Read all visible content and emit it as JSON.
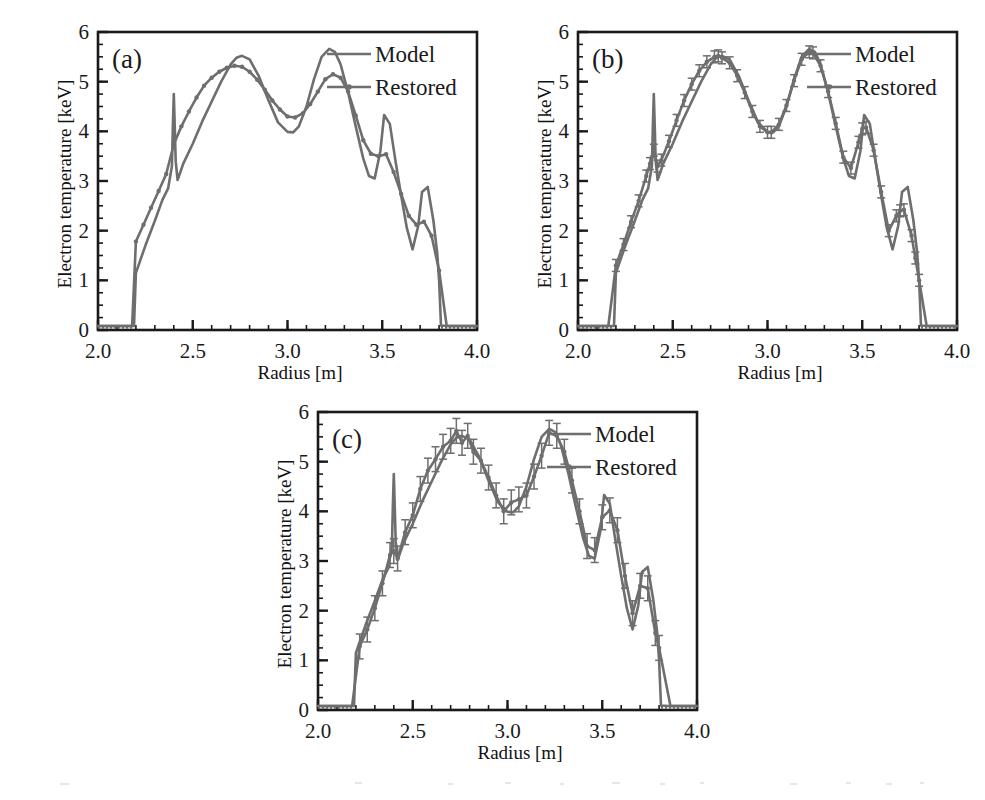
{
  "figure": {
    "background": "#ffffff",
    "line_color": "#6e6e6e",
    "axis_color": "#1a1a1a",
    "panels": [
      "a",
      "b",
      "c"
    ]
  },
  "chart_data": [
    {
      "type": "line",
      "panel_label": "(a)",
      "title": "",
      "xlabel": "Radius [m]",
      "ylabel": "Electron temperature [keV]",
      "xlim": [
        2.0,
        4.0
      ],
      "ylim": [
        0,
        6
      ],
      "xticks": [
        2.0,
        2.5,
        3.0,
        3.5,
        4.0
      ],
      "xticklabels": [
        "2.0",
        "2.5",
        "3.0",
        "3.5",
        "4.0"
      ],
      "yticks": [
        0,
        1,
        2,
        3,
        4,
        5,
        6
      ],
      "yticklabels": [
        "0",
        "1",
        "2",
        "3",
        "4",
        "5",
        "6"
      ],
      "xminor_step": 0.1,
      "yminor_step": 0.25,
      "grid": false,
      "legend_position": "top-right",
      "legend": [
        "Model",
        "Restored"
      ],
      "errorbars": false,
      "series": [
        {
          "name": "Model",
          "marker": "none",
          "x": [
            2.0,
            2.05,
            2.1,
            2.15,
            2.19,
            2.2,
            2.25,
            2.3,
            2.34,
            2.37,
            2.39,
            2.395,
            2.4,
            2.405,
            2.41,
            2.42,
            2.45,
            2.5,
            2.55,
            2.6,
            2.65,
            2.7,
            2.73,
            2.76,
            2.8,
            2.85,
            2.9,
            2.95,
            3.0,
            3.03,
            3.06,
            3.1,
            3.14,
            3.18,
            3.22,
            3.25,
            3.28,
            3.32,
            3.36,
            3.4,
            3.43,
            3.46,
            3.49,
            3.51,
            3.54,
            3.57,
            3.6,
            3.63,
            3.66,
            3.69,
            3.71,
            3.74,
            3.77,
            3.79,
            3.8,
            3.81,
            3.85,
            3.9,
            3.95,
            4.0
          ],
          "y": [
            0.08,
            0.08,
            0.08,
            0.08,
            0.08,
            1.15,
            1.7,
            2.2,
            2.62,
            2.85,
            3.3,
            4.1,
            4.75,
            4.1,
            3.4,
            3.02,
            3.35,
            3.75,
            4.2,
            4.6,
            5.0,
            5.35,
            5.48,
            5.52,
            5.45,
            5.1,
            4.62,
            4.18,
            3.99,
            3.98,
            4.1,
            4.5,
            5.05,
            5.5,
            5.66,
            5.6,
            5.35,
            4.78,
            4.1,
            3.45,
            3.1,
            3.05,
            3.6,
            4.33,
            4.15,
            3.4,
            2.7,
            2.05,
            1.62,
            2.1,
            2.78,
            2.88,
            2.2,
            1.55,
            1.0,
            0.09,
            0.08,
            0.08,
            0.08,
            0.08
          ]
        },
        {
          "name": "Restored",
          "marker": "dot",
          "x": [
            2.0,
            2.06,
            2.12,
            2.18,
            2.2,
            2.24,
            2.28,
            2.32,
            2.36,
            2.4,
            2.44,
            2.48,
            2.52,
            2.56,
            2.6,
            2.64,
            2.68,
            2.72,
            2.76,
            2.8,
            2.84,
            2.88,
            2.92,
            2.96,
            3.0,
            3.04,
            3.08,
            3.12,
            3.16,
            3.2,
            3.24,
            3.28,
            3.32,
            3.36,
            3.4,
            3.44,
            3.48,
            3.52,
            3.56,
            3.6,
            3.64,
            3.68,
            3.72,
            3.76,
            3.8,
            3.84,
            3.9,
            3.96,
            4.0
          ],
          "y": [
            0.08,
            0.08,
            0.08,
            0.08,
            1.78,
            2.12,
            2.46,
            2.8,
            3.14,
            3.74,
            4.1,
            4.4,
            4.68,
            4.92,
            5.08,
            5.2,
            5.28,
            5.32,
            5.3,
            5.2,
            5.04,
            4.84,
            4.62,
            4.44,
            4.3,
            4.28,
            4.36,
            4.55,
            4.8,
            5.05,
            5.15,
            5.08,
            4.8,
            4.32,
            3.82,
            3.55,
            3.5,
            3.54,
            3.18,
            2.74,
            2.3,
            2.12,
            2.18,
            1.9,
            1.2,
            0.08,
            0.08,
            0.08,
            0.08
          ]
        }
      ]
    },
    {
      "type": "line",
      "panel_label": "(b)",
      "title": "",
      "xlabel": "Radius [m]",
      "ylabel": "Electron temperature [keV]",
      "xlim": [
        2.0,
        4.0
      ],
      "ylim": [
        0,
        6
      ],
      "xticks": [
        2.0,
        2.5,
        3.0,
        3.5,
        4.0
      ],
      "xticklabels": [
        "2.0",
        "2.5",
        "3.0",
        "3.5",
        "4.0"
      ],
      "yticks": [
        0,
        1,
        2,
        3,
        4,
        5,
        6
      ],
      "yticklabels": [
        "0",
        "1",
        "2",
        "3",
        "4",
        "5",
        "6"
      ],
      "xminor_step": 0.1,
      "yminor_step": 0.25,
      "grid": false,
      "legend_position": "top-right",
      "legend": [
        "Model",
        "Restored"
      ],
      "errorbars": true,
      "errorbar_magnitude": 0.12,
      "series": [
        {
          "name": "Model",
          "marker": "none",
          "x": [
            2.0,
            2.05,
            2.1,
            2.15,
            2.19,
            2.2,
            2.25,
            2.3,
            2.34,
            2.37,
            2.39,
            2.395,
            2.4,
            2.405,
            2.41,
            2.42,
            2.45,
            2.5,
            2.55,
            2.6,
            2.65,
            2.7,
            2.73,
            2.76,
            2.8,
            2.85,
            2.9,
            2.95,
            3.0,
            3.03,
            3.06,
            3.1,
            3.14,
            3.18,
            3.22,
            3.25,
            3.28,
            3.32,
            3.36,
            3.4,
            3.43,
            3.46,
            3.49,
            3.51,
            3.54,
            3.57,
            3.6,
            3.63,
            3.66,
            3.69,
            3.71,
            3.74,
            3.77,
            3.79,
            3.8,
            3.81,
            3.85,
            3.9,
            3.95,
            4.0
          ],
          "y": [
            0.08,
            0.08,
            0.08,
            0.08,
            0.08,
            1.15,
            1.7,
            2.2,
            2.62,
            2.85,
            3.3,
            4.1,
            4.75,
            4.1,
            3.4,
            3.02,
            3.35,
            3.75,
            4.2,
            4.6,
            5.0,
            5.35,
            5.48,
            5.52,
            5.45,
            5.1,
            4.62,
            4.18,
            3.99,
            3.98,
            4.1,
            4.5,
            5.05,
            5.5,
            5.66,
            5.6,
            5.35,
            4.78,
            4.1,
            3.45,
            3.1,
            3.05,
            3.6,
            4.33,
            4.15,
            3.4,
            2.7,
            2.05,
            1.62,
            2.1,
            2.78,
            2.88,
            2.2,
            1.55,
            1.0,
            0.09,
            0.08,
            0.08,
            0.08,
            0.08
          ]
        },
        {
          "name": "Restored",
          "marker": "dot",
          "x": [
            2.0,
            2.08,
            2.16,
            2.2,
            2.24,
            2.28,
            2.32,
            2.36,
            2.38,
            2.4,
            2.42,
            2.44,
            2.48,
            2.52,
            2.56,
            2.6,
            2.64,
            2.68,
            2.72,
            2.74,
            2.76,
            2.8,
            2.84,
            2.88,
            2.92,
            2.96,
            3.0,
            3.02,
            3.06,
            3.1,
            3.14,
            3.18,
            3.22,
            3.24,
            3.28,
            3.32,
            3.36,
            3.4,
            3.44,
            3.48,
            3.5,
            3.52,
            3.56,
            3.6,
            3.64,
            3.68,
            3.7,
            3.72,
            3.76,
            3.78,
            3.8,
            3.84,
            3.92,
            4.0
          ],
          "y": [
            0.08,
            0.08,
            0.08,
            1.3,
            1.72,
            2.18,
            2.6,
            3.1,
            3.35,
            3.62,
            3.3,
            3.42,
            3.8,
            4.22,
            4.62,
            4.95,
            5.22,
            5.4,
            5.5,
            5.52,
            5.48,
            5.38,
            5.12,
            4.78,
            4.4,
            4.1,
            3.98,
            3.98,
            4.14,
            4.52,
            5.02,
            5.45,
            5.6,
            5.58,
            5.32,
            4.8,
            4.16,
            3.48,
            3.26,
            3.78,
            4.05,
            4.08,
            3.62,
            2.78,
            2.0,
            2.3,
            2.4,
            2.42,
            1.9,
            1.45,
            1.0,
            0.08,
            0.08,
            0.08
          ]
        }
      ]
    },
    {
      "type": "line",
      "panel_label": "(c)",
      "title": "",
      "xlabel": "Radius [m]",
      "ylabel": "Electron temperature [keV]",
      "xlim": [
        2.0,
        4.0
      ],
      "ylim": [
        0,
        6
      ],
      "xticks": [
        2.0,
        2.5,
        3.0,
        3.5,
        4.0
      ],
      "xticklabels": [
        "2.0",
        "2.5",
        "3.0",
        "3.5",
        "4.0"
      ],
      "yticks": [
        0,
        1,
        2,
        3,
        4,
        5,
        6
      ],
      "yticklabels": [
        "0",
        "1",
        "2",
        "3",
        "4",
        "5",
        "6"
      ],
      "xminor_step": 0.1,
      "yminor_step": 0.25,
      "grid": false,
      "legend_position": "top-right",
      "legend": [
        "Model",
        "Restored"
      ],
      "errorbars": true,
      "errorbar_magnitude": 0.25,
      "series": [
        {
          "name": "Model",
          "marker": "none",
          "x": [
            2.0,
            2.05,
            2.1,
            2.15,
            2.19,
            2.2,
            2.25,
            2.3,
            2.34,
            2.37,
            2.39,
            2.395,
            2.4,
            2.405,
            2.41,
            2.42,
            2.45,
            2.5,
            2.55,
            2.6,
            2.65,
            2.7,
            2.73,
            2.76,
            2.8,
            2.85,
            2.9,
            2.95,
            3.0,
            3.03,
            3.06,
            3.1,
            3.14,
            3.18,
            3.22,
            3.25,
            3.28,
            3.32,
            3.36,
            3.4,
            3.43,
            3.46,
            3.49,
            3.51,
            3.54,
            3.57,
            3.6,
            3.63,
            3.66,
            3.69,
            3.71,
            3.74,
            3.77,
            3.79,
            3.8,
            3.81,
            3.85,
            3.9,
            3.95,
            4.0
          ],
          "y": [
            0.08,
            0.08,
            0.08,
            0.08,
            0.08,
            1.15,
            1.7,
            2.2,
            2.62,
            2.85,
            3.3,
            4.1,
            4.75,
            4.1,
            3.4,
            3.02,
            3.35,
            3.75,
            4.2,
            4.6,
            5.0,
            5.35,
            5.48,
            5.52,
            5.45,
            5.1,
            4.62,
            4.18,
            3.99,
            3.98,
            4.1,
            4.5,
            5.05,
            5.5,
            5.66,
            5.6,
            5.35,
            4.78,
            4.1,
            3.45,
            3.1,
            3.05,
            3.6,
            4.33,
            4.15,
            3.4,
            2.7,
            2.05,
            1.62,
            2.1,
            2.78,
            2.88,
            2.2,
            1.55,
            1.0,
            0.09,
            0.08,
            0.08,
            0.08,
            0.08
          ]
        },
        {
          "name": "Restored",
          "marker": "dot",
          "x": [
            2.0,
            2.1,
            2.18,
            2.22,
            2.26,
            2.3,
            2.34,
            2.38,
            2.4,
            2.42,
            2.46,
            2.5,
            2.54,
            2.58,
            2.62,
            2.66,
            2.7,
            2.73,
            2.76,
            2.79,
            2.82,
            2.86,
            2.9,
            2.94,
            2.98,
            3.02,
            3.06,
            3.1,
            3.14,
            3.18,
            3.22,
            3.26,
            3.3,
            3.34,
            3.38,
            3.42,
            3.46,
            3.5,
            3.54,
            3.58,
            3.62,
            3.66,
            3.7,
            3.74,
            3.78,
            3.8,
            3.86,
            3.94,
            4.0
          ],
          "y": [
            0.08,
            0.08,
            0.08,
            1.28,
            1.62,
            2.05,
            2.55,
            3.12,
            3.2,
            3.05,
            3.58,
            3.92,
            4.45,
            4.82,
            5.05,
            5.3,
            5.42,
            5.62,
            5.38,
            5.52,
            5.2,
            5.02,
            4.68,
            4.32,
            4.0,
            4.18,
            4.24,
            4.32,
            4.7,
            5.12,
            5.58,
            5.52,
            5.2,
            4.62,
            4.0,
            3.3,
            3.22,
            3.88,
            4.02,
            3.62,
            2.7,
            1.95,
            2.5,
            2.45,
            1.55,
            1.25,
            0.08,
            0.08,
            0.08
          ]
        }
      ]
    }
  ]
}
